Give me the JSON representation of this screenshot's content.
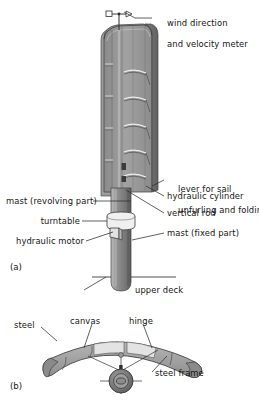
{
  "figure": {
    "title_a": "(a)",
    "title_b": "(b)"
  },
  "panel_a": {
    "tag": "(a)",
    "labels": {
      "wind_meter_line1": "wind direction",
      "wind_meter_line2": "and velocity meter",
      "lever_line1": "lever for sail",
      "lever_line2": "unfurling and folding",
      "hydraulic_cylinder": "hydraulic cylinder",
      "vertical_rod": "vertical rod",
      "mast_fixed": "mast (fixed part)",
      "mast_revolving": "mast (revolving part)",
      "turntable": "turntable",
      "hydraulic_motor": "hydraulic motor",
      "upper_deck": "upper deck"
    }
  },
  "panel_b": {
    "tag": "(b)",
    "labels": {
      "steel": "steel",
      "canvas": "canvas",
      "hinge": "hinge",
      "steel_frame": "steel frame"
    }
  },
  "colors": {
    "ink": "#141414",
    "leader": "#3a3a3a",
    "sail_face": "#9a9a9a",
    "sail_face_dark": "#7e7e7e",
    "sail_edge": "#5f5f5f",
    "mast": "#8d8d8d",
    "mast_shadow": "#5c5c5c",
    "collar": "#efefef",
    "hub_dark": "#6b6b6b",
    "background": "#ffffff"
  }
}
